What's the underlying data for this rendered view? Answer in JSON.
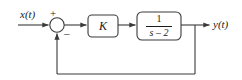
{
  "diagram": {
    "type": "control-system-block-diagram",
    "input_signal": "x(t)",
    "output_signal": "y(t)",
    "summing_junction": {
      "positive_sign": "+",
      "negative_sign": "–"
    },
    "gain_block": {
      "label": "K"
    },
    "transfer_function_block": {
      "numerator": "1",
      "denominator": "s – 2",
      "full": "1/(s-2)"
    },
    "feedback": {
      "label": "",
      "type": "unity"
    },
    "colors": {
      "line": "#3a3a3a",
      "text": "#1a1a1a",
      "background": "#ffffff"
    }
  }
}
